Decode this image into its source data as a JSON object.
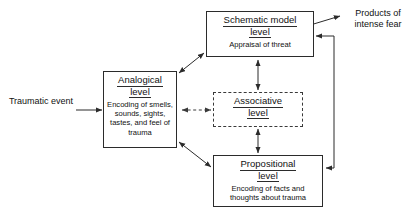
{
  "diagram": {
    "nodes": {
      "schematic": {
        "title_line1": "Schematic model",
        "title_line2": "level",
        "body": "Appraisal of threat"
      },
      "analogical": {
        "title_line1": "Analogical",
        "title_line2": "level",
        "body": "Encoding of smells, sounds, sights, tastes, and feel of trauma"
      },
      "associative": {
        "title_line1": "Associative",
        "title_line2": "level",
        "body": ""
      },
      "propositional": {
        "title_line1": "Propositional",
        "title_line2": "level",
        "body": "Encoding of facts and thoughts about trauma"
      }
    },
    "labels": {
      "input": "Traumatic event",
      "output": "Products of intense fear"
    },
    "colors": {
      "stroke": "#2b2b2b",
      "dashed_stroke": "#3a3a3a",
      "background": "#ffffff",
      "text": "#111111"
    }
  }
}
